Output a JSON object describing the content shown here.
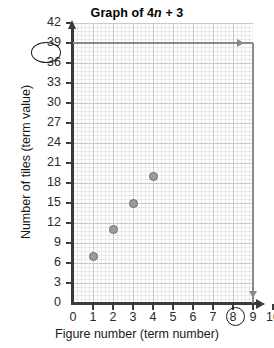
{
  "chart_data": {
    "type": "scatter",
    "title": "Graph of 4n + 3",
    "title_prefix": "Graph of 4",
    "title_variable": "n",
    "title_suffix": " + 3",
    "xlabel": "Figure number (term number)",
    "ylabel": "Number of tiles (term value)",
    "x": [
      1,
      2,
      3,
      4
    ],
    "values": [
      7,
      11,
      15,
      19
    ],
    "points": [
      {
        "x": 1,
        "y": 7
      },
      {
        "x": 2,
        "y": 11
      },
      {
        "x": 3,
        "y": 15
      },
      {
        "x": 4,
        "y": 19
      }
    ],
    "xlim": [
      0,
      10
    ],
    "ylim": [
      0,
      42
    ],
    "x_ticks": [
      "0",
      "1",
      "2",
      "3",
      "4",
      "5",
      "6",
      "7",
      "8",
      "9",
      "10"
    ],
    "y_ticks": [
      "0",
      "3",
      "6",
      "9",
      "12",
      "15",
      "18",
      "21",
      "24",
      "27",
      "30",
      "33",
      "36",
      "39",
      "42"
    ],
    "x_tick_step": 1,
    "y_tick_step": 3,
    "grid": true,
    "legend": false,
    "point_color": "#9c9c9c",
    "point_edge_color": "#6f6f6f",
    "axis_color": "#3b3b3b",
    "grid_major_color": "#c9c9cf",
    "grid_minor_color": "#e9e9ec",
    "annotations": {
      "highlighted_y_value": "39",
      "highlighted_x_value": "9",
      "reading_line_color": "#8a8a8a",
      "description": "Reading lines from y = 39 across to x = 9"
    }
  }
}
